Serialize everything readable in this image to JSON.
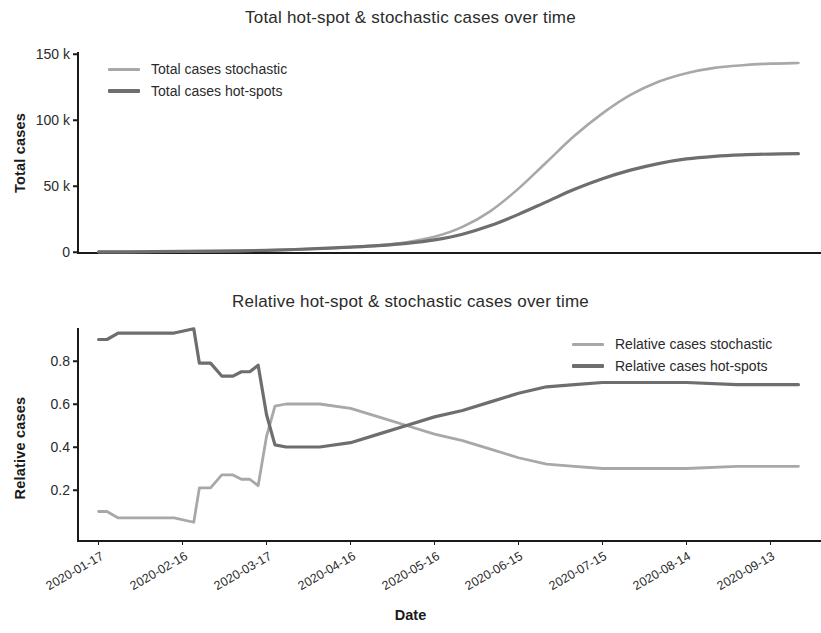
{
  "figure": {
    "xlabel": "Date",
    "width": 821,
    "height": 633
  },
  "colors": {
    "stochastic": "#a8a8a8",
    "hotspots": "#6e6e6e",
    "axis": "#1a1a1a",
    "text": "#2b2b2b",
    "background": "#ffffff"
  },
  "charts": {
    "top": {
      "title": "Total hot-spot & stochastic cases over time",
      "ylabel": "Total cases",
      "yticks": [
        "0",
        "50 k",
        "100 k",
        "150 k"
      ],
      "legend": {
        "stochastic": "Total cases stochastic",
        "hotspots": "Total cases hot-spots"
      }
    },
    "bottom": {
      "title": "Relative hot-spot & stochastic cases over time",
      "ylabel": "Relative cases",
      "yticks": [
        "0.2",
        "0.4",
        "0.6",
        "0.8"
      ],
      "legend": {
        "stochastic": "Relative cases stochastic",
        "hotspots": "Relative cases hot-spots"
      }
    }
  },
  "xticks": [
    "2020-01-17",
    "2020-02-16",
    "2020-03-17",
    "2020-04-16",
    "2020-05-16",
    "2020-06-15",
    "2020-07-15",
    "2020-08-14",
    "2020-09-13"
  ],
  "chart_data": [
    {
      "type": "line",
      "title": "Total hot-spot & stochastic cases over time",
      "xlabel": "Date",
      "ylabel": "Total cases",
      "ylim": [
        0,
        157000
      ],
      "yticks": [
        0,
        50000,
        100000,
        150000
      ],
      "ytick_labels": [
        "0",
        "50 k",
        "100 k",
        "150 k"
      ],
      "xlim": [
        "2020-01-10",
        "2020-09-30"
      ],
      "grid": false,
      "legend_position": "upper left",
      "x": [
        "2020-01-17",
        "2020-01-27",
        "2020-02-06",
        "2020-02-16",
        "2020-02-26",
        "2020-03-07",
        "2020-03-17",
        "2020-03-27",
        "2020-04-06",
        "2020-04-16",
        "2020-04-26",
        "2020-05-06",
        "2020-05-16",
        "2020-05-26",
        "2020-06-05",
        "2020-06-15",
        "2020-06-25",
        "2020-07-05",
        "2020-07-15",
        "2020-07-25",
        "2020-08-04",
        "2020-08-14",
        "2020-08-24",
        "2020-09-03",
        "2020-09-13",
        "2020-09-23"
      ],
      "series": [
        {
          "name": "Total cases stochastic",
          "color": "#a8a8a8",
          "values": [
            60,
            110,
            190,
            320,
            520,
            800,
            1200,
            1800,
            2600,
            3600,
            5000,
            7400,
            11500,
            19000,
            31000,
            48000,
            68000,
            88000,
            105000,
            119000,
            129000,
            135500,
            139500,
            141500,
            142700,
            143200
          ]
        },
        {
          "name": "Total cases hot-spots",
          "color": "#6e6e6e",
          "values": [
            90,
            150,
            250,
            400,
            600,
            900,
            1300,
            1900,
            2700,
            3700,
            4900,
            6600,
            9200,
            13500,
            20000,
            28500,
            38000,
            47500,
            55500,
            62000,
            67000,
            70500,
            72500,
            73600,
            74200,
            74500
          ]
        }
      ]
    },
    {
      "type": "line",
      "title": "Relative hot-spot & stochastic cases over time",
      "xlabel": "Date",
      "ylabel": "Relative cases",
      "ylim": [
        0.02,
        0.97
      ],
      "yticks": [
        0.2,
        0.4,
        0.6,
        0.8
      ],
      "ytick_labels": [
        "0.2",
        "0.4",
        "0.6",
        "0.8"
      ],
      "xlim": [
        "2020-01-10",
        "2020-09-30"
      ],
      "grid": false,
      "legend_position": "upper right",
      "x": [
        "2020-01-17",
        "2020-01-20",
        "2020-01-24",
        "2020-02-03",
        "2020-02-13",
        "2020-02-20",
        "2020-02-22",
        "2020-02-26",
        "2020-03-01",
        "2020-03-05",
        "2020-03-08",
        "2020-03-11",
        "2020-03-14",
        "2020-03-17",
        "2020-03-20",
        "2020-03-24",
        "2020-03-29",
        "2020-04-05",
        "2020-04-16",
        "2020-04-26",
        "2020-05-06",
        "2020-05-16",
        "2020-05-26",
        "2020-06-05",
        "2020-06-15",
        "2020-06-25",
        "2020-07-05",
        "2020-07-15",
        "2020-08-01",
        "2020-08-14",
        "2020-09-01",
        "2020-09-13",
        "2020-09-23"
      ],
      "series": [
        {
          "name": "Relative cases stochastic",
          "color": "#a8a8a8",
          "values": [
            0.1,
            0.1,
            0.07,
            0.07,
            0.07,
            0.05,
            0.21,
            0.21,
            0.27,
            0.27,
            0.25,
            0.25,
            0.22,
            0.45,
            0.59,
            0.6,
            0.6,
            0.6,
            0.58,
            0.54,
            0.5,
            0.46,
            0.43,
            0.39,
            0.35,
            0.32,
            0.31,
            0.3,
            0.3,
            0.3,
            0.31,
            0.31,
            0.31
          ]
        },
        {
          "name": "Relative cases hot-spots",
          "color": "#6e6e6e",
          "values": [
            0.9,
            0.9,
            0.93,
            0.93,
            0.93,
            0.95,
            0.79,
            0.79,
            0.73,
            0.73,
            0.75,
            0.75,
            0.78,
            0.55,
            0.41,
            0.4,
            0.4,
            0.4,
            0.42,
            0.46,
            0.5,
            0.54,
            0.57,
            0.61,
            0.65,
            0.68,
            0.69,
            0.7,
            0.7,
            0.7,
            0.69,
            0.69,
            0.69
          ]
        }
      ]
    }
  ]
}
